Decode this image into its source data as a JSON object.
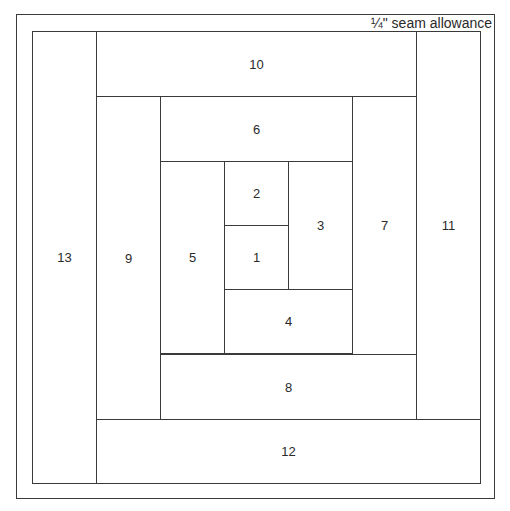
{
  "diagram": {
    "seam_label": "¼\" seam allowance",
    "pieces": [
      {
        "label": "1",
        "x": 224,
        "y": 225,
        "w": 65,
        "h": 65
      },
      {
        "label": "2",
        "x": 224,
        "y": 161,
        "w": 65,
        "h": 65
      },
      {
        "label": "3",
        "x": 288,
        "y": 161,
        "w": 65,
        "h": 129
      },
      {
        "label": "4",
        "x": 224,
        "y": 289,
        "w": 129,
        "h": 65
      },
      {
        "label": "5",
        "x": 160,
        "y": 161,
        "w": 65,
        "h": 193
      },
      {
        "label": "6",
        "x": 160,
        "y": 96,
        "w": 193,
        "h": 66
      },
      {
        "label": "7",
        "x": 352,
        "y": 96,
        "w": 65,
        "h": 259
      },
      {
        "label": "8",
        "x": 160,
        "y": 354,
        "w": 257,
        "h": 66
      },
      {
        "label": "9",
        "x": 96,
        "y": 96,
        "w": 65,
        "h": 324
      },
      {
        "label": "10",
        "x": 96,
        "y": 31,
        "w": 321,
        "h": 66
      },
      {
        "label": "11",
        "x": 416,
        "y": 31,
        "w": 65,
        "h": 389
      },
      {
        "label": "12",
        "x": 96,
        "y": 419,
        "w": 385,
        "h": 65
      },
      {
        "label": "13",
        "x": 32,
        "y": 31,
        "w": 65,
        "h": 453
      }
    ]
  }
}
